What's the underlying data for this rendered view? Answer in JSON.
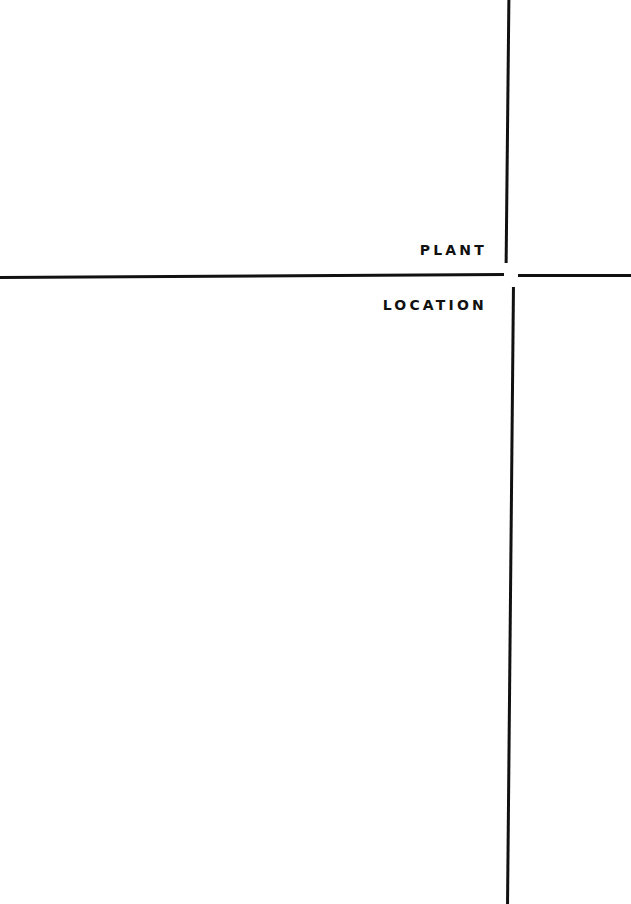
{
  "cover": {
    "title_line1": "PLANT",
    "title_line2": "LOCATION"
  },
  "colors": {
    "background": "#ffffff",
    "ink": "#111111"
  }
}
